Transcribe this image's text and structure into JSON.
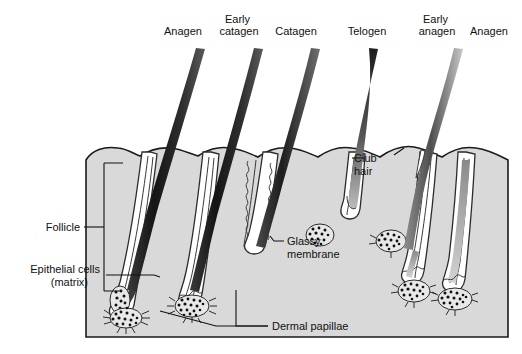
{
  "figure": {
    "title_visible": false,
    "stage_labels": [
      {
        "id": "anagen-1",
        "label": "Anagen",
        "lines": [
          "Anagen"
        ],
        "x": 183,
        "y": 30
      },
      {
        "id": "early-catagen",
        "label": "Early catagen",
        "lines": [
          "Early",
          "catagen"
        ],
        "x": 239,
        "y": 18
      },
      {
        "id": "catagen",
        "label": "Catagen",
        "lines": [
          "Catagen"
        ],
        "x": 296,
        "y": 30
      },
      {
        "id": "telogen",
        "label": "Telogen",
        "lines": [
          "Telogen"
        ],
        "x": 367,
        "y": 30
      },
      {
        "id": "early-anagen",
        "label": "Early anagen",
        "lines": [
          "Early",
          "anagen"
        ],
        "x": 437,
        "y": 18
      },
      {
        "id": "anagen-2",
        "label": "Anagen",
        "lines": [
          "Anagen"
        ],
        "x": 486,
        "y": 30
      }
    ],
    "callouts": [
      {
        "id": "follicle",
        "lines": [
          "Follicle"
        ],
        "x": 44,
        "y": 230
      },
      {
        "id": "epithelial-cells",
        "lines": [
          "Epithelial cells",
          "(matrix)"
        ],
        "x": 52,
        "y": 277
      },
      {
        "id": "dermal-papillae",
        "lines": [
          "Dermal papillae"
        ],
        "x": 272,
        "y": 325
      },
      {
        "id": "club-hair",
        "lines": [
          "Club",
          "hair"
        ],
        "x": 367,
        "y": 160
      },
      {
        "id": "glassy-membrane",
        "lines": [
          "Glassy",
          "membrane"
        ],
        "x": 287,
        "y": 240
      }
    ],
    "colors": {
      "skin_fill": "#d9d9d9",
      "outline": "#1a1a1a",
      "hair_shaft_dark": "#2a2a2a",
      "hair_shaft_light": "#b8b8b8",
      "follicle_fill": "#ffffff",
      "papilla_dot": "#111111",
      "text": "#111111",
      "page_background": "#ffffff"
    },
    "structure": {
      "skin_block": {
        "left": 85,
        "top": 140,
        "right": 510,
        "bottom": 337
      },
      "follicle_count": 6,
      "cycle_order": [
        "Anagen",
        "Early catagen",
        "Catagen",
        "Telogen",
        "Early anagen",
        "Anagen"
      ]
    }
  }
}
